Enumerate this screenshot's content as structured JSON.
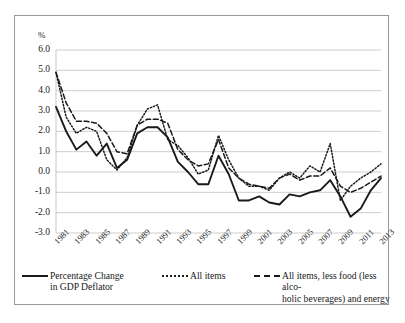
{
  "chart_data": {
    "type": "line",
    "title": "",
    "xlabel": "",
    "ylabel": "%",
    "ylim": [
      -3.0,
      6.0
    ],
    "ytick_step": 1.0,
    "grid": true,
    "legend_position": "bottom",
    "x": [
      1981,
      1982,
      1983,
      1984,
      1985,
      1986,
      1987,
      1988,
      1989,
      1990,
      1991,
      1992,
      1993,
      1994,
      1995,
      1996,
      1997,
      1998,
      1999,
      2000,
      2001,
      2002,
      2003,
      2004,
      2005,
      2006,
      2007,
      2008,
      2009,
      2010,
      2011,
      2012,
      2013
    ],
    "xtick_labels": [
      "1981",
      "1983",
      "1985",
      "1987",
      "1989",
      "1991",
      "1993",
      "1995",
      "1997",
      "1999",
      "2001",
      "2003",
      "2005",
      "2007",
      "2009",
      "2011",
      "2013"
    ],
    "ytick_labels": [
      "6.0",
      "5.0",
      "4.0",
      "3.0",
      "2.0",
      "1.0",
      "0.0",
      "-1.0",
      "-2.0",
      "-3.0"
    ],
    "series": [
      {
        "name": "Percentage Change in GDP Deflator",
        "style": "solid",
        "color": "#1a1a1a",
        "values": [
          3.2,
          2.0,
          1.1,
          1.5,
          0.8,
          1.4,
          0.2,
          0.6,
          1.9,
          2.2,
          2.2,
          1.7,
          0.5,
          0.0,
          -0.6,
          -0.6,
          0.8,
          -0.1,
          -1.4,
          -1.4,
          -1.2,
          -1.5,
          -1.6,
          -1.1,
          -1.2,
          -1.0,
          -0.9,
          -0.4,
          -1.2,
          -2.2,
          -1.8,
          -0.9,
          -0.3
        ]
      },
      {
        "name": "All items",
        "style": "dotted",
        "color": "#1a1a1a",
        "values": [
          4.9,
          2.7,
          1.9,
          2.2,
          2.0,
          0.6,
          0.1,
          0.7,
          2.3,
          3.1,
          3.3,
          1.6,
          1.3,
          0.7,
          -0.1,
          0.1,
          1.8,
          0.6,
          -0.3,
          -0.7,
          -0.7,
          -0.9,
          -0.3,
          0.0,
          -0.3,
          0.3,
          0.0,
          1.4,
          -1.4,
          -0.7,
          -0.3,
          0.0,
          0.4
        ]
      },
      {
        "name": "All items, less food (less alcoholic beverages) and energy",
        "style": "dashed",
        "color": "#1a1a1a",
        "values": [
          4.9,
          3.4,
          2.5,
          2.5,
          2.4,
          1.9,
          1.0,
          0.9,
          2.3,
          2.6,
          2.6,
          2.4,
          1.1,
          0.6,
          0.3,
          0.4,
          1.6,
          0.2,
          -0.3,
          -0.6,
          -0.7,
          -0.8,
          -0.3,
          -0.1,
          -0.4,
          -0.2,
          -0.2,
          0.2,
          -0.7,
          -1.0,
          -0.8,
          -0.5,
          -0.2
        ]
      }
    ]
  },
  "axis": {
    "y_unit": "%"
  },
  "legend": {
    "items": [
      {
        "label": "Percentage Change\nin GDP Deflator",
        "style": "solid"
      },
      {
        "label": "All items",
        "style": "dotted"
      },
      {
        "label": "All items, less food (less alco-\nholic beverages) and energy",
        "style": "dashed"
      }
    ]
  }
}
